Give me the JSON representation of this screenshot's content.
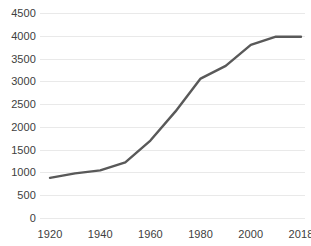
{
  "chart_data": {
    "type": "line",
    "title": "",
    "subtitle": "",
    "xlabel": "",
    "ylabel": "",
    "ylim": [
      0,
      4500
    ],
    "ytick_values": [
      0,
      500,
      1000,
      1500,
      2000,
      2500,
      3000,
      3500,
      4000,
      4500
    ],
    "ytick_labels": [
      "0",
      "500",
      "1000",
      "1500",
      "2000",
      "2500",
      "3000",
      "3500",
      "4000",
      "4500"
    ],
    "xtick_labels": [
      "1920",
      "1940",
      "1960",
      "1980",
      "2000",
      "2018"
    ],
    "x": [
      "1920",
      "1930",
      "1940",
      "1950",
      "1960",
      "1970",
      "1980",
      "1990",
      "2000",
      "2010",
      "2018"
    ],
    "values": [
      880,
      980,
      1045,
      1220,
      1700,
      2340,
      3060,
      3340,
      3800,
      3980,
      3980
    ],
    "series": [
      {
        "name": "Series 1",
        "color": "#595959",
        "values": [
          880,
          980,
          1045,
          1220,
          1700,
          2340,
          3060,
          3340,
          3800,
          3980,
          3980
        ]
      }
    ],
    "grid": "horizontal",
    "grid_color": "#e9e9e9",
    "legend": "none",
    "markers": "none",
    "line_color": "#595959",
    "axis_label_color": "#404040",
    "background": "#ffffff"
  }
}
